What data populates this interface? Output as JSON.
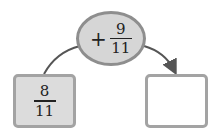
{
  "operation": {
    "operator": "+",
    "numerator": "9",
    "denominator": "11"
  },
  "start_box": {
    "numerator": "8",
    "denominator": "11"
  },
  "result_box": {
    "value": ""
  },
  "colors": {
    "ellipse_fill": "#d6d6d6",
    "ellipse_border": "#8e8e8e",
    "box_border": "#a3a3a3",
    "start_fill": "#dcdcdc",
    "arrow": "#555555"
  }
}
